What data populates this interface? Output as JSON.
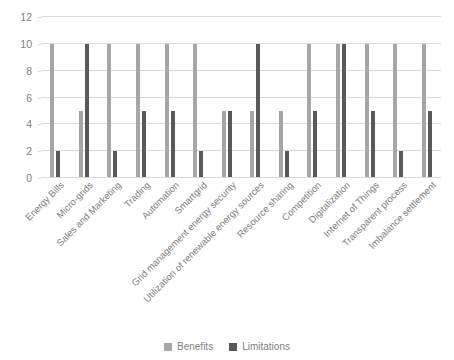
{
  "chart_data": {
    "type": "bar",
    "title": "",
    "subtitle": "",
    "xlabel": "",
    "ylabel": "",
    "ylim": [
      0,
      12
    ],
    "yticks": [
      0,
      2,
      4,
      6,
      8,
      10,
      12
    ],
    "grid": true,
    "legend_position": "bottom",
    "categories": [
      "Energy Bills",
      "Micro-grids",
      "Sales and Marketing",
      "Trading",
      "Automation",
      "Smartgrid",
      "Grid management energy security",
      "Utilization of renewable energy sources",
      "Resource sharing",
      "Competition",
      "Digitalization",
      "Internet of Things",
      "Transparent process",
      "Imbalance settlement"
    ],
    "series": [
      {
        "name": "Benefits",
        "color": "#a6a6a6",
        "values": [
          10,
          5,
          10,
          10,
          10,
          10,
          5,
          5,
          5,
          10,
          10,
          10,
          10,
          10
        ]
      },
      {
        "name": "Limitations",
        "color": "#595959",
        "values": [
          2,
          10,
          2,
          5,
          5,
          2,
          5,
          10,
          2,
          5,
          10,
          5,
          2,
          5
        ]
      }
    ]
  },
  "colors": {
    "gridline": "#d9d9d9",
    "tick_text": "#7f7f7f",
    "axis_label_text": "#808080",
    "background": "#ffffff"
  }
}
